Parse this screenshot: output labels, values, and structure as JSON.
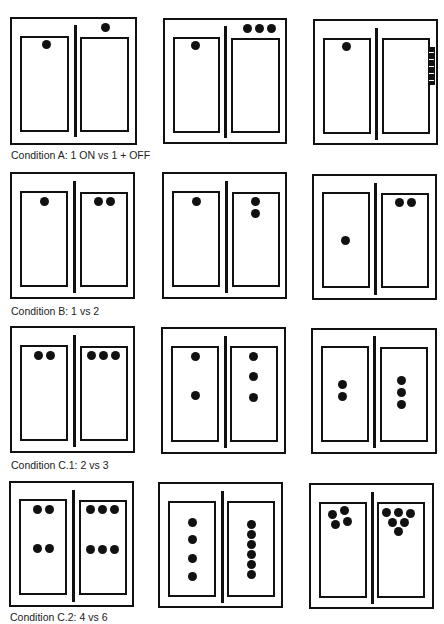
{
  "figure": {
    "rows": [
      {
        "caption": "Condition A: 1 ON vs 1 + OFF",
        "panels": [
          {
            "left_dots": 1,
            "right_dots": 1,
            "note": "right dot outside (above) right box"
          },
          {
            "left_dots": 1,
            "right_dots": 3,
            "note": "three dots above right box"
          },
          {
            "left_dots": 1,
            "right_dots": 0,
            "note": "black strip with notches on right outer edge"
          }
        ]
      },
      {
        "caption": "Condition B: 1 vs 2",
        "panels": [
          {
            "left_dots": 1,
            "right_dots": 2,
            "arrangement": "top, horizontal pair"
          },
          {
            "left_dots": 1,
            "right_dots": 2,
            "arrangement": "top, vertical pair"
          },
          {
            "left_dots": 1,
            "right_dots": 2,
            "arrangement": "left low, right top pair"
          }
        ]
      },
      {
        "caption": "Condition C.1: 2 vs 3",
        "panels": [
          {
            "left_dots": 2,
            "right_dots": 3,
            "arrangement": "horizontal rows at top"
          },
          {
            "left_dots": 2,
            "right_dots": 3,
            "arrangement": "vertical spread"
          },
          {
            "left_dots": 2,
            "right_dots": 3,
            "arrangement": "vertical tight cluster center"
          }
        ]
      },
      {
        "caption": "Condition C.2: 4 vs 6",
        "panels": [
          {
            "left_dots": 4,
            "right_dots": 6,
            "arrangement": "two rows"
          },
          {
            "left_dots": 4,
            "right_dots": 6,
            "arrangement": "vertical columns"
          },
          {
            "left_dots": 4,
            "right_dots": 6,
            "arrangement": "clusters at top"
          }
        ]
      }
    ]
  }
}
